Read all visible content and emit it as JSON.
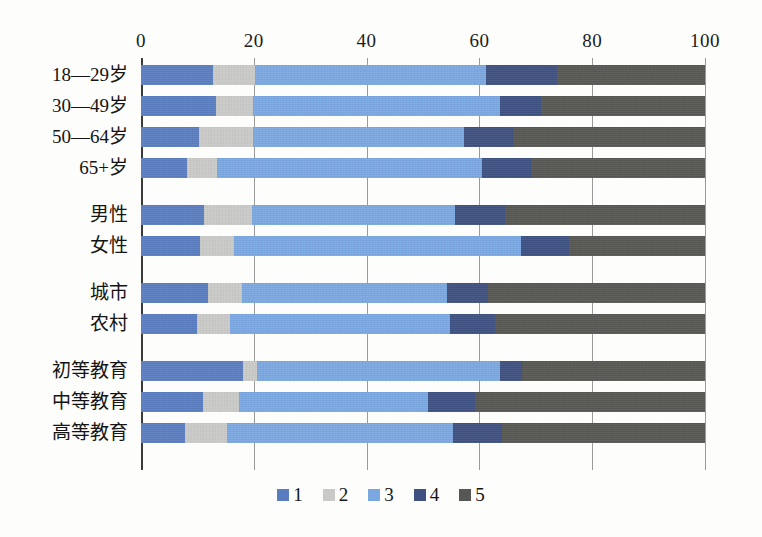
{
  "chart_data": {
    "type": "bar",
    "subtype": "stacked-horizontal-100percent",
    "title": "",
    "xlabel": "",
    "ylabel": "",
    "xlim": [
      0,
      100
    ],
    "xticks": [
      "0",
      "20",
      "40",
      "60",
      "80",
      "100"
    ],
    "grid": true,
    "legend_position": "bottom",
    "legend": [
      "1",
      "2",
      "3",
      "4",
      "5"
    ],
    "colors": {
      "s1": "#5a7dc0",
      "s2": "#c9c9c7",
      "s3": "#7ba7e0",
      "s4": "#3f5180",
      "s5": "#575753"
    },
    "groups": [
      {
        "name": "age",
        "categories": [
          "18—29岁",
          "30—49岁",
          "50—64岁",
          "65+岁"
        ],
        "rows": [
          {
            "label": "18—29岁",
            "values": [
              12.8,
              7.4,
              40.9,
              12.6,
              26.3
            ]
          },
          {
            "label": "30—49岁",
            "values": [
              13.3,
              6.6,
              43.8,
              7.3,
              29.0
            ]
          },
          {
            "label": "50—64岁",
            "values": [
              10.3,
              9.6,
              37.4,
              8.7,
              34.0
            ]
          },
          {
            "label": "65+岁",
            "values": [
              8.2,
              5.3,
              47.0,
              8.7,
              30.8
            ]
          }
        ]
      },
      {
        "name": "gender",
        "categories": [
          "男性",
          "女性"
        ],
        "rows": [
          {
            "label": "男性",
            "values": [
              11.2,
              8.5,
              35.9,
              9.0,
              35.4
            ]
          },
          {
            "label": "女性",
            "values": [
              10.5,
              6.0,
              50.9,
              8.5,
              24.1
            ]
          }
        ]
      },
      {
        "name": "settlement",
        "categories": [
          "城市",
          "农村"
        ],
        "rows": [
          {
            "label": "城市",
            "values": [
              11.9,
              6.0,
              36.3,
              7.3,
              38.5
            ]
          },
          {
            "label": "农村",
            "values": [
              9.9,
              5.9,
              39.0,
              8.0,
              37.2
            ]
          }
        ]
      },
      {
        "name": "education",
        "categories": [
          "初等教育",
          "中等教育",
          "高等教育"
        ],
        "rows": [
          {
            "label": "初等教育",
            "values": [
              18.1,
              2.5,
              43.1,
              3.9,
              32.4
            ]
          },
          {
            "label": "中等教育",
            "values": [
              11.0,
              6.4,
              33.5,
              8.3,
              40.8
            ]
          },
          {
            "label": "高等教育",
            "values": [
              7.8,
              7.4,
              40.1,
              8.7,
              36.0
            ]
          }
        ]
      }
    ]
  },
  "axis": {
    "ticks": [
      {
        "label": "0",
        "value": 0
      },
      {
        "label": "20",
        "value": 20
      },
      {
        "label": "40",
        "value": 40
      },
      {
        "label": "60",
        "value": 60
      },
      {
        "label": "80",
        "value": 80
      },
      {
        "label": "100",
        "value": 100
      }
    ]
  },
  "legend": {
    "items": [
      {
        "label": "1",
        "color": "#5a7dc0"
      },
      {
        "label": "2",
        "color": "#c9c9c7"
      },
      {
        "label": "3",
        "color": "#7ba7e0"
      },
      {
        "label": "4",
        "color": "#3f5180"
      },
      {
        "label": "5",
        "color": "#575753"
      }
    ]
  }
}
